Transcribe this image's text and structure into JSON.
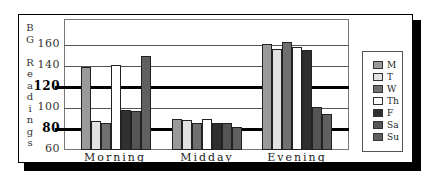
{
  "chart_data": {
    "type": "bar",
    "title": "",
    "xlabel": "",
    "ylabel": "BG Readings",
    "ylim": [
      60,
      180
    ],
    "yticks": [
      60,
      80,
      100,
      120,
      140,
      160
    ],
    "emphasized_ticks": [
      80,
      120
    ],
    "grid": true,
    "legend_position": "right",
    "categories": [
      "Morning",
      "Midday",
      "Evening"
    ],
    "series": [
      {
        "name": "M",
        "color": "#9a9a9a",
        "values": [
          139,
          90,
          161
        ]
      },
      {
        "name": "T",
        "color": "#e2e2e2",
        "values": [
          88,
          89,
          156
        ]
      },
      {
        "name": "W",
        "color": "#707070",
        "values": [
          86,
          86,
          163
        ]
      },
      {
        "name": "Th",
        "color": "#ffffff",
        "values": [
          141,
          90,
          158
        ]
      },
      {
        "name": "F",
        "color": "#303030",
        "values": [
          98,
          86,
          155
        ]
      },
      {
        "name": "Sa",
        "color": "#555555",
        "values": [
          97,
          86,
          101
        ]
      },
      {
        "name": "Su",
        "color": "#606060",
        "values": [
          150,
          82,
          94
        ]
      }
    ]
  },
  "labels": {
    "ylabel_chars": [
      "B",
      "G",
      " ",
      "R",
      "e",
      "a",
      "d",
      "i",
      "n",
      "g",
      "s"
    ],
    "yticks": [
      "160",
      "140",
      "120",
      "100",
      "80",
      "60"
    ],
    "categories": [
      "Morning",
      "Midday",
      "Evening"
    ],
    "legend": [
      "M",
      "T",
      "W",
      "Th",
      "F",
      "Sa",
      "Su"
    ]
  }
}
